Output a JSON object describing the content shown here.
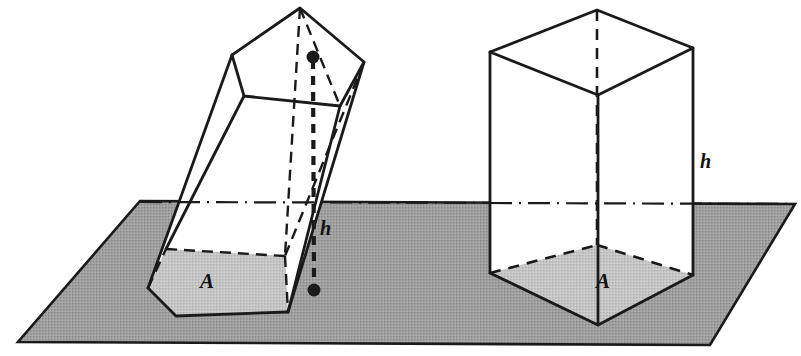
{
  "figure": {
    "background_color": "#ffffff",
    "ink_color": "#1a1a1a",
    "plane_fill_color": "#9b9b9b",
    "base_fill_color": "#c3c3c3",
    "face_fill_color": "#ffffff",
    "width": 801,
    "height": 356
  },
  "plane": {
    "name": "ground-plane",
    "corners": [
      [
        140,
        201
      ],
      [
        795,
        204
      ],
      [
        710,
        345
      ],
      [
        18,
        342
      ]
    ],
    "level_line_label": "plane level"
  },
  "left_solid": {
    "name": "oblique-pentagonal-prism",
    "type": "oblique prism",
    "base_label": "A",
    "height_label": "h",
    "height_line": {
      "top_point": [
        313,
        57
      ],
      "bottom_point": [
        314,
        290
      ],
      "style": "dashed with round endpoints"
    },
    "top_face_points": [
      [
        300,
        8
      ],
      [
        364,
        62
      ],
      [
        340,
        106
      ],
      [
        244,
        96
      ],
      [
        232,
        55
      ]
    ],
    "bottom_face_points": [
      [
        166,
        249
      ],
      [
        285,
        256
      ],
      [
        288,
        312
      ],
      [
        176,
        316
      ],
      [
        148,
        288
      ]
    ]
  },
  "right_solid": {
    "name": "right-rectangular-prism",
    "type": "right prism",
    "base_label": "A",
    "height_label": "h",
    "top_face_points": [
      [
        597,
        10
      ],
      [
        693,
        48
      ],
      [
        598,
        95
      ],
      [
        490,
        52
      ]
    ],
    "bottom_face_points": [
      [
        597,
        245
      ],
      [
        693,
        275
      ],
      [
        598,
        325
      ],
      [
        490,
        273
      ]
    ],
    "height_edge": {
      "x": 693,
      "y_top": 48,
      "y_bottom": 275
    }
  },
  "labels": {
    "left_height": "h",
    "left_area": "A",
    "right_height": "h",
    "right_area": "A"
  }
}
